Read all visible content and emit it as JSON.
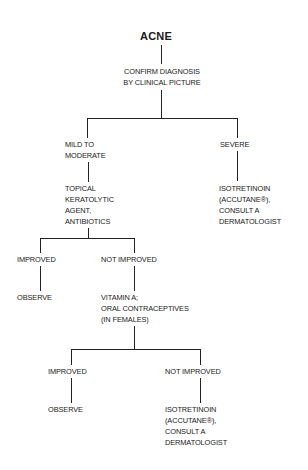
{
  "diagram": {
    "title": "ACNE",
    "nodes": {
      "confirm": "CONFIRM DIAGNOSIS\nBY CLINICAL PICTURE",
      "mild": "MILD TO\nMODERATE",
      "severe": "SEVERE",
      "topical": "TOPICAL\nKERATOLYTIC\nAGENT,\nANTIBIOTICS",
      "severe_treatment": "ISOTRETINOIN\n(ACCUTANE®),\nCONSULT A\nDERMATOLOGIST",
      "improved_1": "IMPROVED",
      "not_improved_1": "NOT IMPROVED",
      "observe_1": "OBSERVE",
      "vitamin": "VITAMIN A;\nORAL CONTRACEPTIVES\n(IN FEMALES)",
      "improved_2": "IMPROVED",
      "not_improved_2": "NOT IMPROVED",
      "observe_2": "OBSERVE",
      "final_treatment": "ISOTRETINOIN\n(ACCUTANE®),\nCONSULT A\nDERMATOLOGIST"
    },
    "edges": [
      [
        "ACNE",
        "CONFIRM DIAGNOSIS BY CLINICAL PICTURE"
      ],
      [
        "CONFIRM DIAGNOSIS BY CLINICAL PICTURE",
        "MILD TO MODERATE"
      ],
      [
        "CONFIRM DIAGNOSIS BY CLINICAL PICTURE",
        "SEVERE"
      ],
      [
        "MILD TO MODERATE",
        "TOPICAL KERATOLYTIC AGENT, ANTIBIOTICS"
      ],
      [
        "SEVERE",
        "ISOTRETINOIN (ACCUTANE®), CONSULT A DERMATOLOGIST"
      ],
      [
        "TOPICAL KERATOLYTIC AGENT, ANTIBIOTICS",
        "IMPROVED"
      ],
      [
        "TOPICAL KERATOLYTIC AGENT, ANTIBIOTICS",
        "NOT IMPROVED"
      ],
      [
        "IMPROVED",
        "OBSERVE"
      ],
      [
        "NOT IMPROVED",
        "VITAMIN A; ORAL CONTRACEPTIVES (IN FEMALES)"
      ],
      [
        "VITAMIN A; ORAL CONTRACEPTIVES (IN FEMALES)",
        "IMPROVED"
      ],
      [
        "VITAMIN A; ORAL CONTRACEPTIVES (IN FEMALES)",
        "NOT IMPROVED"
      ],
      [
        "IMPROVED",
        "OBSERVE"
      ],
      [
        "NOT IMPROVED",
        "ISOTRETINOIN (ACCUTANE®), CONSULT A DERMATOLOGIST"
      ]
    ],
    "line_color": "#222222",
    "text_color": "#1a1a1a",
    "background": "#ffffff"
  }
}
